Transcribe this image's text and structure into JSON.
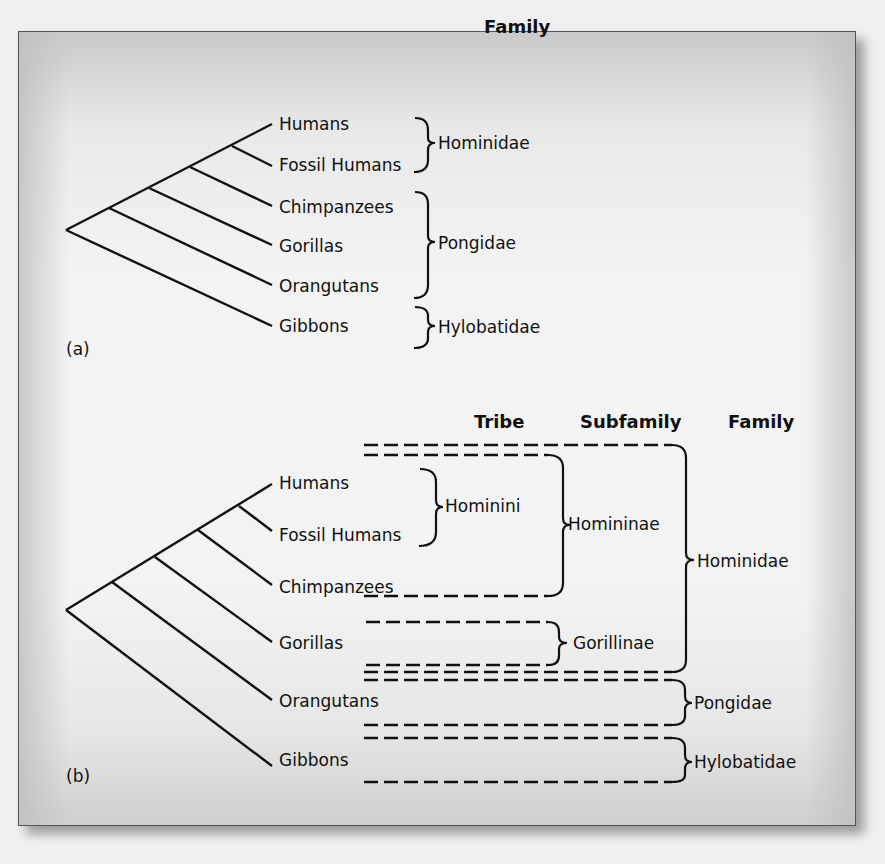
{
  "figure_a": {
    "panel_label": "(a)",
    "column_header": "Family",
    "taxa": [
      "Humans",
      "Fossil Humans",
      "Chimpanzees",
      "Gorillas",
      "Orangutans",
      "Gibbons"
    ],
    "families": [
      {
        "name": "Hominidae",
        "members": [
          "Humans",
          "Fossil Humans"
        ]
      },
      {
        "name": "Pongidae",
        "members": [
          "Chimpanzees",
          "Gorillas",
          "Orangutans"
        ]
      },
      {
        "name": "Hylobatidae",
        "members": [
          "Gibbons"
        ]
      }
    ]
  },
  "figure_b": {
    "panel_label": "(b)",
    "column_headers": {
      "tribe": "Tribe",
      "subfamily": "Subfamily",
      "family": "Family"
    },
    "taxa": [
      "Humans",
      "Fossil Humans",
      "Chimpanzees",
      "Gorillas",
      "Orangutans",
      "Gibbons"
    ],
    "tribes": [
      {
        "name": "Hominini",
        "members": [
          "Humans",
          "Fossil Humans"
        ]
      }
    ],
    "subfamilies": [
      {
        "name": "Homininae",
        "members": [
          "Humans",
          "Fossil Humans",
          "Chimpanzees"
        ]
      },
      {
        "name": "Gorillinae",
        "members": [
          "Gorillas"
        ]
      }
    ],
    "families": [
      {
        "name": "Hominidae",
        "members": [
          "Humans",
          "Fossil Humans",
          "Chimpanzees",
          "Gorillas"
        ]
      },
      {
        "name": "Pongidae",
        "members": [
          "Orangutans"
        ]
      },
      {
        "name": "Hylobatidae",
        "members": [
          "Gibbons"
        ]
      }
    ]
  }
}
